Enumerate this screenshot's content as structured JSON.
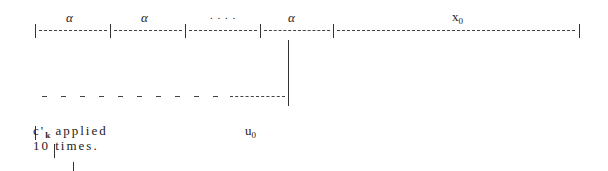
{
  "diagram": {
    "top_labels": [
      {
        "text": "α",
        "x": 68
      },
      {
        "text": "α",
        "x": 143
      },
      {
        "text": ". . . .",
        "x": 210
      },
      {
        "text": "α",
        "x": 291
      },
      {
        "text": "x",
        "sub": "0",
        "x": 454
      }
    ],
    "top_row": "|--------|--------|--------|--------|---------------------------|",
    "bottom_row": "|-|-|-|-|-|-|-|-|-|-|-------|",
    "caption_line1_prefix": "c'",
    "caption_line1_sub": "k",
    "caption_line1_rest": " applied",
    "caption_line2": "10 times.",
    "u_label": "u",
    "u_sub": "0"
  }
}
